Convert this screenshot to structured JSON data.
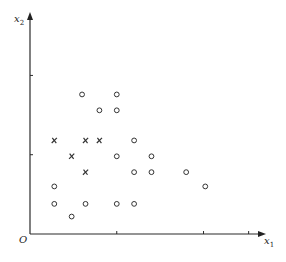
{
  "chart_data": {
    "type": "scatter",
    "title": "",
    "xlabel": "x",
    "xlabel_sub": "1",
    "ylabel": "x",
    "ylabel_sub": "2",
    "origin_label": "O",
    "xlim": [
      0,
      13.6
    ],
    "ylim": [
      0,
      14.0
    ],
    "x_ticks": [
      5,
      10,
      12.6
    ],
    "y_ticks": [
      5,
      10
    ],
    "grid": false,
    "legend": "none",
    "series": [
      {
        "name": "negative",
        "marker": "cross",
        "points": [
          [
            1.4,
            5.9
          ],
          [
            3.2,
            5.9
          ],
          [
            4.0,
            5.9
          ],
          [
            2.4,
            4.9
          ],
          [
            3.2,
            3.9
          ]
        ]
      },
      {
        "name": "positive",
        "marker": "circle",
        "points": [
          [
            3.0,
            8.8
          ],
          [
            5.0,
            8.8
          ],
          [
            4.0,
            7.8
          ],
          [
            5.0,
            7.8
          ],
          [
            6.0,
            5.9
          ],
          [
            5.0,
            4.9
          ],
          [
            7.0,
            4.9
          ],
          [
            6.0,
            3.9
          ],
          [
            7.0,
            3.9
          ],
          [
            9.0,
            3.9
          ],
          [
            1.4,
            3.0
          ],
          [
            10.1,
            3.0
          ],
          [
            1.4,
            1.9
          ],
          [
            3.2,
            1.9
          ],
          [
            5.0,
            1.9
          ],
          [
            6.0,
            1.9
          ],
          [
            2.4,
            1.1
          ]
        ]
      }
    ]
  }
}
